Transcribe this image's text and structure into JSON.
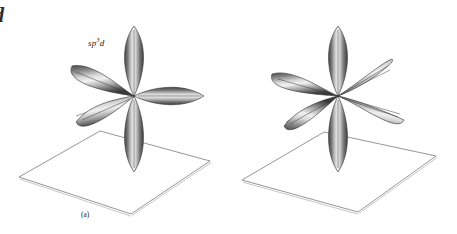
{
  "figure": {
    "background_color": "#ffffff",
    "width": 457,
    "height": 234
  },
  "edge_fragments": {
    "top": "d",
    "middle": "e",
    "lower": "s"
  },
  "panels": [
    {
      "id": "a",
      "caption": "(a)",
      "label_prefix": "sp",
      "label_exponent_1": "3",
      "label_mid": "d",
      "label_exponent_2": "",
      "label_plain": "sp3d",
      "lobe_count": 5,
      "geometry": "trigonal bipyramidal"
    },
    {
      "id": "b",
      "caption": "(b)",
      "label_prefix": "sp",
      "label_exponent_1": "3",
      "label_mid": "d",
      "label_exponent_2": "2",
      "label_plain": "sp3d2",
      "lobe_count": 6,
      "geometry": "octahedral"
    }
  ],
  "colors": {
    "lobe_dark": "#3a3a3a",
    "lobe_mid": "#8d8d8d",
    "lobe_light": "#e8e8e8",
    "lobe_outline": "#2e2e2e",
    "plane_line": "#7d7d7d",
    "plane_line_shadow": "#b9b9b9",
    "axis_line": "#3c3c3c",
    "text": "#1a1a1a"
  }
}
